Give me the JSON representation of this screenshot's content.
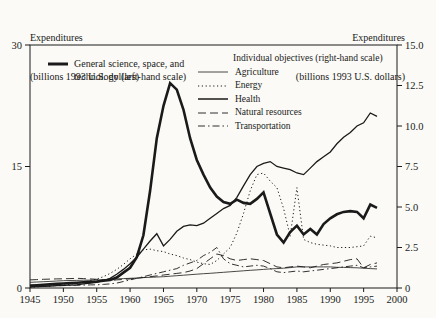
{
  "titles": {
    "left": {
      "line1": "Expenditures",
      "line2": "(billions 1993 U.S. dollars)"
    },
    "right": {
      "line1": "Expenditures",
      "line2": "(billions 1993 U.S. dollars)"
    }
  },
  "chart_data": {
    "type": "line",
    "background": "#fbfaf6",
    "line_color": "#1a1a1a",
    "grid": false,
    "x_axis": {
      "min": 1945,
      "max": 2000,
      "tick_step": 5,
      "tick_labels": [
        "1945",
        "1950",
        "1955",
        "1960",
        "1965",
        "1970",
        "1975",
        "1980",
        "1985",
        "1990",
        "1995",
        "2000"
      ]
    },
    "left_axis": {
      "min": 0,
      "max": 30,
      "ticks": [
        0,
        15,
        30
      ],
      "tick_labels": [
        "0",
        "15",
        "30"
      ],
      "title": "Expenditures (billions 1993 U.S. dollars)"
    },
    "right_axis": {
      "min": 0,
      "max": 15,
      "ticks": [
        0,
        2.5,
        5,
        7.5,
        10,
        12.5,
        15
      ],
      "tick_labels": [
        "0",
        "2.5",
        "5.0",
        "7.5",
        "10.0",
        "12.5",
        "15.0"
      ],
      "title": "Expenditures (billions 1993 U.S. dollars)"
    },
    "legend_left": {
      "line1": "General science, space, and",
      "line2": "technology (left-hand scale)"
    },
    "legend_right": {
      "header": "Individual objectives (right-hand scale)",
      "items": [
        "Agriculture",
        "Energy",
        "Health",
        "Natural resources",
        "Transportation"
      ]
    },
    "series": [
      {
        "id": "agriculture",
        "name": "Agriculture",
        "scale": "right",
        "line_style": "solid-thin",
        "start_year": 1945,
        "values": [
          0.35,
          0.37,
          0.39,
          0.41,
          0.43,
          0.45,
          0.46,
          0.47,
          0.48,
          0.49,
          0.5,
          0.52,
          0.54,
          0.56,
          0.58,
          0.6,
          0.62,
          0.64,
          0.66,
          0.68,
          0.7,
          0.73,
          0.76,
          0.79,
          0.82,
          0.85,
          0.88,
          0.91,
          0.94,
          0.97,
          1.0,
          1.03,
          1.06,
          1.09,
          1.12,
          1.15,
          1.18,
          1.2,
          1.22,
          1.26,
          1.3,
          1.3,
          1.3,
          1.3,
          1.3,
          1.3,
          1.28,
          1.27,
          1.26,
          1.25,
          1.22,
          1.2,
          1.18
        ]
      },
      {
        "id": "energy",
        "name": "Energy",
        "scale": "right",
        "line_style": "dotted",
        "start_year": 1945,
        "values": [
          0.05,
          0.07,
          0.1,
          0.12,
          0.15,
          0.18,
          0.22,
          0.28,
          0.35,
          0.45,
          0.55,
          0.7,
          0.9,
          1.15,
          1.45,
          1.8,
          2.1,
          2.35,
          2.4,
          2.3,
          2.25,
          2.1,
          2.0,
          1.85,
          1.75,
          1.6,
          1.5,
          1.45,
          1.7,
          2.1,
          2.5,
          3.4,
          4.6,
          6.0,
          7.0,
          7.1,
          6.6,
          6.2,
          4.9,
          3.2,
          6.2,
          3.0,
          2.8,
          2.7,
          2.65,
          2.6,
          2.5,
          2.5,
          2.5,
          2.55,
          2.6,
          3.2,
          3.1
        ]
      },
      {
        "id": "health",
        "name": "Health",
        "scale": "right",
        "line_style": "solid-medium",
        "start_year": 1945,
        "values": [
          0.05,
          0.08,
          0.1,
          0.12,
          0.14,
          0.16,
          0.18,
          0.2,
          0.25,
          0.3,
          0.35,
          0.45,
          0.6,
          0.85,
          1.15,
          1.5,
          1.9,
          2.4,
          2.9,
          3.35,
          2.6,
          3.0,
          3.5,
          3.8,
          3.9,
          3.85,
          4.0,
          4.3,
          4.6,
          4.9,
          5.1,
          5.6,
          6.3,
          7.0,
          7.5,
          7.7,
          7.8,
          7.5,
          7.4,
          7.3,
          7.1,
          7.0,
          7.4,
          7.8,
          8.1,
          8.4,
          8.9,
          9.3,
          9.6,
          10.0,
          10.2,
          10.8,
          10.6
        ]
      },
      {
        "id": "natural-resources",
        "name": "Natural resources",
        "scale": "right",
        "line_style": "dashed",
        "start_year": 1945,
        "values": [
          0.5,
          0.52,
          0.54,
          0.55,
          0.56,
          0.57,
          0.58,
          0.6,
          0.58,
          0.56,
          0.54,
          0.5,
          0.46,
          0.5,
          0.53,
          0.56,
          0.6,
          0.65,
          0.7,
          0.75,
          0.8,
          0.85,
          0.9,
          0.95,
          1.05,
          1.2,
          1.5,
          1.8,
          2.1,
          2.0,
          1.8,
          1.7,
          1.75,
          1.8,
          1.75,
          1.7,
          1.5,
          1.3,
          1.25,
          1.3,
          1.35,
          1.3,
          1.25,
          1.35,
          1.45,
          1.5,
          1.55,
          1.65,
          1.75,
          1.8,
          1.25,
          1.45,
          1.55
        ]
      },
      {
        "id": "transportation",
        "name": "Transportation",
        "scale": "right",
        "line_style": "dashdot",
        "start_year": 1945,
        "values": [
          0.1,
          0.11,
          0.12,
          0.13,
          0.14,
          0.15,
          0.16,
          0.17,
          0.18,
          0.19,
          0.2,
          0.22,
          0.25,
          0.3,
          0.4,
          0.5,
          0.6,
          0.7,
          0.8,
          0.9,
          1.0,
          1.1,
          1.2,
          1.4,
          1.55,
          1.7,
          2.0,
          2.2,
          2.5,
          1.8,
          1.5,
          1.4,
          1.3,
          1.35,
          1.4,
          1.35,
          1.2,
          1.0,
          0.95,
          1.0,
          1.05,
          1.0,
          1.05,
          1.1,
          1.15,
          1.2,
          1.25,
          1.3,
          1.35,
          1.4,
          1.25,
          1.3,
          1.35
        ]
      },
      {
        "id": "general-science",
        "name": "General science, space, and technology",
        "scale": "left",
        "line_style": "solid-thick",
        "start_year": 1945,
        "values": [
          0.3,
          0.35,
          0.4,
          0.45,
          0.5,
          0.55,
          0.6,
          0.65,
          0.7,
          0.75,
          0.8,
          0.9,
          1.0,
          1.3,
          1.9,
          2.5,
          3.8,
          6.5,
          12.0,
          18.5,
          22.5,
          25.3,
          24.5,
          22.0,
          18.5,
          15.8,
          14.0,
          12.4,
          11.3,
          10.6,
          10.4,
          10.9,
          10.5,
          10.4,
          11.0,
          11.8,
          9.2,
          6.6,
          5.6,
          6.9,
          7.7,
          6.6,
          7.3,
          6.6,
          7.9,
          8.6,
          9.1,
          9.4,
          9.5,
          9.4,
          8.6,
          10.3,
          9.9
        ]
      }
    ]
  }
}
